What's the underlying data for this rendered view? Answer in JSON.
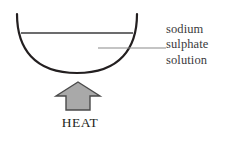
{
  "diagram": {
    "type": "science-apparatus-diagram",
    "colors": {
      "beaker_outline": "#231f20",
      "liquid_surface_line": "#3b3b3d",
      "leader_line": "#8a8a8a",
      "arrow_fill": "#a9a9a9",
      "arrow_outline": "#4a4a4a",
      "label_text": "#3a3a3c",
      "heat_text": "#231f20",
      "background": "#ffffff"
    },
    "beaker": {
      "name": "beaker",
      "left_rim_x": 17,
      "right_rim_x": 137,
      "rim_y": 14,
      "bottom_y": 73,
      "outline_width": 2.2
    },
    "liquid": {
      "name": "sodium-sulphate-solution",
      "surface_y": 33,
      "surface_left_x": 21,
      "surface_right_x": 133
    },
    "leader": {
      "name": "label-leader-line",
      "start_x": 98,
      "end_x": 166,
      "y": 48
    },
    "arrow": {
      "name": "heat-arrow",
      "direction": "up",
      "left_x": 56,
      "right_x": 100,
      "tip_y": 82,
      "base_y": 110
    }
  },
  "labels": {
    "solution_label": {
      "line1": "sodium",
      "line2": "sulphate",
      "line3": "solution"
    },
    "heat": "HEAT"
  }
}
